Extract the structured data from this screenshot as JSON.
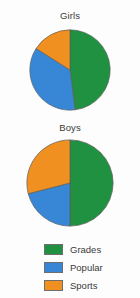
{
  "figure": {
    "background_color": "#fdfdfd",
    "text_color": "#3a3a3a"
  },
  "charts": [
    {
      "title": "Girls"
    },
    {
      "title": "Boys"
    }
  ],
  "legend": {
    "items": [
      {
        "label": "Grades",
        "color": "#1f9140"
      },
      {
        "label": "Popular",
        "color": "#3787d6"
      },
      {
        "label": "Sports",
        "color": "#f09020"
      }
    ]
  },
  "chart_data": [
    {
      "type": "pie",
      "title": "Girls",
      "labels": [
        "Grades",
        "Popular",
        "Sports"
      ],
      "values": [
        48,
        36,
        16
      ],
      "colors": [
        "#1f9140",
        "#3787d6",
        "#f09020"
      ],
      "start_angle_deg": 0,
      "direction": "clockwise",
      "legend": "bottom",
      "grid": false
    },
    {
      "type": "pie",
      "title": "Boys",
      "labels": [
        "Grades",
        "Popular",
        "Sports"
      ],
      "values": [
        50,
        21,
        29
      ],
      "colors": [
        "#1f9140",
        "#3787d6",
        "#f09020"
      ],
      "start_angle_deg": 0,
      "direction": "clockwise",
      "legend": "bottom",
      "grid": false
    }
  ]
}
